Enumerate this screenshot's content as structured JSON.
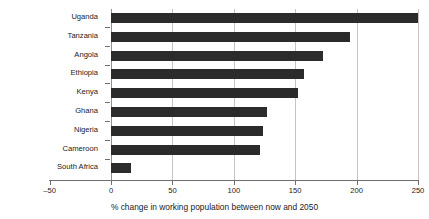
{
  "chart_data": {
    "type": "bar",
    "orientation": "horizontal",
    "title": "",
    "xlabel": "% change in working population between now and 2050",
    "ylabel": "",
    "categories": [
      "Uganda",
      "Tanzania",
      "Angola",
      "Ethiopia",
      "Kenya",
      "Ghana",
      "Nigeria",
      "Cameroon",
      "South Africa"
    ],
    "values": [
      250,
      195,
      173,
      157,
      152,
      127,
      124,
      121,
      16
    ],
    "series": [
      {
        "name": "% change in working population",
        "values": [
          250,
          195,
          173,
          157,
          152,
          127,
          124,
          121,
          16
        ]
      }
    ],
    "xlim": [
      -50,
      250
    ],
    "xticks": [
      -50,
      0,
      50,
      100,
      150,
      200,
      250
    ],
    "xtick_labels": [
      "–50",
      "0",
      "50",
      "100",
      "150",
      "200",
      "250"
    ],
    "grid": "vertical",
    "legend": "none",
    "bar_color": "#2b2b2b",
    "grid_color": "#c4c4c4",
    "axis_color": "#6e6e6e"
  },
  "figure": {
    "title_remnant": "",
    "xlabel": "% change in working population between now and 2050"
  }
}
